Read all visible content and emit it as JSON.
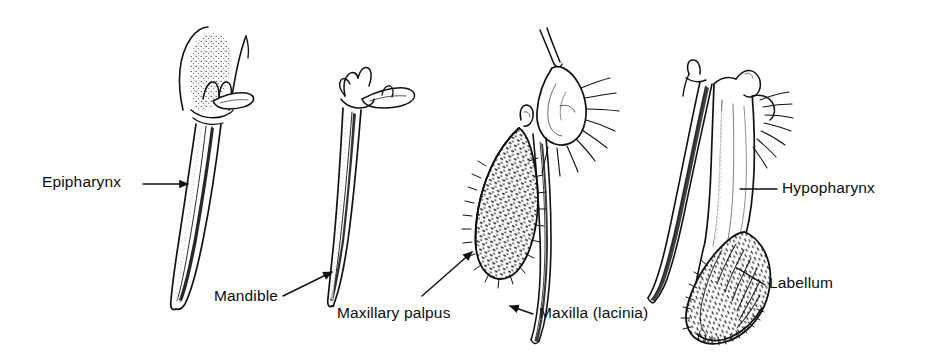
{
  "figure": {
    "kind": "scientific-line-drawing",
    "background_color": "#ffffff",
    "ink_color": "#111111",
    "specimen_count": 4
  },
  "labels": {
    "epipharynx": "Epipharynx",
    "mandible": "Mandible",
    "maxillary_palpus": "Maxillary palpus",
    "maxilla_lacinia": "Maxilla (lacinia)",
    "hypopharynx": "Hypopharynx",
    "labellum": "Labellum"
  },
  "leaders": [
    {
      "name": "epipharynx-leader",
      "style": "horizontal-arrow",
      "arrowhead": "right"
    },
    {
      "name": "mandible-leader",
      "style": "diagonal-arrow",
      "arrowhead": "up-right"
    },
    {
      "name": "maxillary-leader",
      "style": "diagonal-arrow",
      "arrowhead": "up-right"
    },
    {
      "name": "maxilla-leader",
      "style": "horizontal-arrow",
      "arrowhead": "left"
    },
    {
      "name": "hypopharynx-leader",
      "style": "horizontal-line",
      "arrowhead": "none"
    },
    {
      "name": "labellum-leader",
      "style": "diagonal-line",
      "arrowhead": "none"
    }
  ],
  "structures": [
    {
      "name": "epipharynx-drawing",
      "description": "long tapering blade with flared stippled Y-shaped base"
    },
    {
      "name": "mandible-drawing",
      "description": "slender elongated blade with branched apical projections"
    },
    {
      "name": "maxilla-palpus-drawing",
      "description": "bristled textured palpus beside a slender lacinia blade"
    },
    {
      "name": "labium-labellum-drawing",
      "description": "labium with hypopharynx stylet and expanded ribbed labellum"
    }
  ]
}
